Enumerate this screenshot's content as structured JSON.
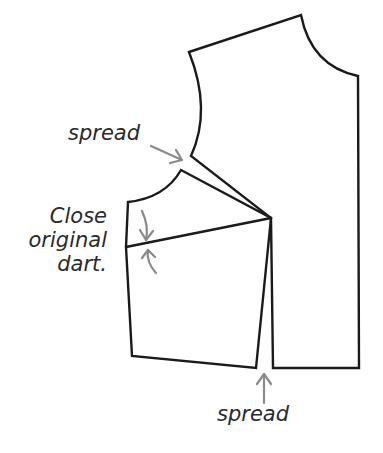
{
  "diagram": {
    "type": "sewing pattern - bodice dart manipulation",
    "colors": {
      "outline": "#1a1a1a",
      "arrows": "#8a8a8a",
      "text": "#2a2a2a",
      "background": "#ffffff"
    },
    "labels": {
      "spread_top": "spread",
      "close_line1": "Close",
      "close_line2": "original",
      "close_line3": "dart.",
      "spread_bottom": "spread"
    },
    "pieces": [
      {
        "name": "main-bodice-piece",
        "description": "Upper/center front bodice piece with shoulder, neckline and armhole"
      },
      {
        "name": "side-bodice-piece",
        "description": "Pivoted side piece with closed original dart line"
      }
    ],
    "arrows": [
      {
        "name": "spread-top-arrow",
        "points_to": "armhole spread"
      },
      {
        "name": "close-dart-arrow-upper",
        "points_to": "dart line from above"
      },
      {
        "name": "close-dart-arrow-lower",
        "points_to": "dart line from below"
      },
      {
        "name": "spread-bottom-arrow",
        "points_to": "waist spread"
      }
    ]
  }
}
